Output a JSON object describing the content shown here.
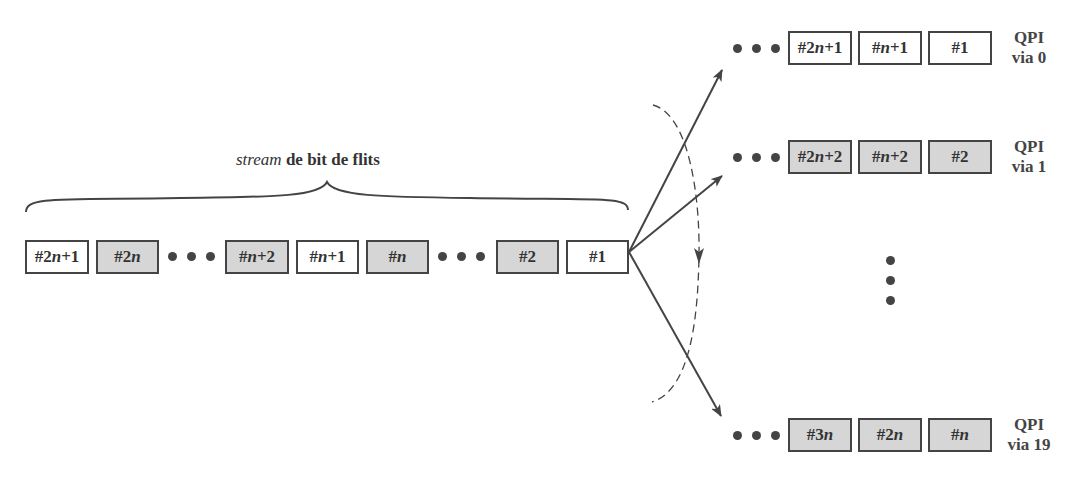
{
  "title": {
    "italic": "stream",
    "rest": " de bit de flits"
  },
  "colors": {
    "stroke": "#444444",
    "grey_fill": "#d6d6d6",
    "white_fill": "#ffffff"
  },
  "stream": {
    "flits": [
      {
        "label": "#2n+1",
        "fill": "white"
      },
      {
        "label": "#2n",
        "fill": "grey"
      },
      {
        "label": "•••",
        "type": "ellipsis"
      },
      {
        "label": "#n+2",
        "fill": "grey"
      },
      {
        "label": "#n+1",
        "fill": "white"
      },
      {
        "label": "#n",
        "fill": "grey"
      },
      {
        "label": "•••",
        "type": "ellipsis"
      },
      {
        "label": "#2",
        "fill": "grey"
      },
      {
        "label": "#1",
        "fill": "white"
      }
    ]
  },
  "lanes": [
    {
      "name_line1": "QPI",
      "name_line2": "via 0",
      "flits": [
        "#2n+1",
        "#n+1",
        "#1"
      ],
      "fill": "white"
    },
    {
      "name_line1": "QPI",
      "name_line2": "via 1",
      "flits": [
        "#2n+2",
        "#n+2",
        "#2"
      ],
      "fill": "grey"
    },
    {
      "name_line1": "QPI",
      "name_line2": "via 19",
      "flits": [
        "#3n",
        "#2n",
        "#n"
      ],
      "fill": "grey"
    }
  ]
}
